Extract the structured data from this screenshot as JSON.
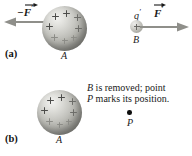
{
  "figure": {
    "panels": [
      {
        "id": "a",
        "label": "(a)",
        "sphere_label": "A",
        "force_label_left": "−F",
        "force_label_left_prime": "′",
        "small_sphere_label": "B",
        "charge_label": "q",
        "charge_label_prime": "′",
        "force_label_right": "F",
        "force_label_right_prime": "′"
      },
      {
        "id": "b",
        "label": "(b)",
        "sphere_label": "A",
        "caption_line1_em": "B",
        "caption_line1_rest": " is removed; point",
        "caption_line2_em": "P",
        "caption_line2_rest": " marks its position.",
        "point_label": "P"
      }
    ],
    "colors": {
      "background": "#ffffff",
      "sphere_shade": "#b0b0aa",
      "arrow": "#8a8a85",
      "text": "#1a1a1a",
      "point": "#0d0d0d",
      "plus_sign": "#4c4c4a"
    },
    "charge_count_sphere_a": 8,
    "charge_count_sphere_b_panel": 8
  }
}
